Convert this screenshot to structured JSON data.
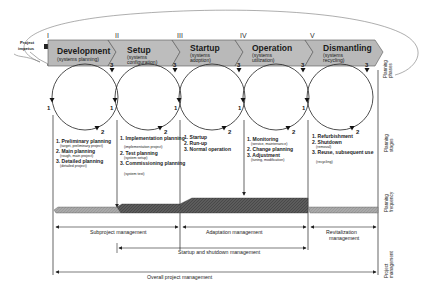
{
  "diagram": {
    "project_impetus": [
      "Project",
      "impetus"
    ],
    "phases": [
      {
        "roman": "I",
        "title": "Development",
        "subtitle": [
          "(systems planning)"
        ]
      },
      {
        "roman": "II",
        "title": "Setup",
        "subtitle": [
          "(systems",
          "configuration)"
        ]
      },
      {
        "roman": "III",
        "title": "Startup",
        "subtitle": [
          "(systems",
          "adoption)"
        ]
      },
      {
        "roman": "IV",
        "title": "Operation",
        "subtitle": [
          "(systems",
          "utilization)"
        ]
      },
      {
        "roman": "V",
        "title": "Dismantling",
        "subtitle": [
          "(systems",
          "recycling)"
        ]
      }
    ],
    "cycle_numbers": [
      "1",
      "2",
      "3"
    ],
    "stages": [
      {
        "items": [
          {
            "label": "1. Preliminary planning",
            "sub": "(target, preliminary project)"
          },
          {
            "label": "2. Main planning",
            "sub": "(rough, main project)"
          },
          {
            "label": "3. Detailed planning",
            "sub": "(detailed project)"
          }
        ]
      },
      {
        "items": [
          {
            "label": "1. Implementation planning",
            "sub": "(implementation project)"
          },
          {
            "label": "2. Test planning",
            "sub": "(system setup)"
          },
          {
            "label": "3. Commissioning planning",
            "sub": "(system test)"
          }
        ]
      },
      {
        "items": [
          {
            "label": "1. Startup",
            "sub": ""
          },
          {
            "label": "2. Run-up",
            "sub": ""
          },
          {
            "label": "3. Normal operation",
            "sub": ""
          }
        ]
      },
      {
        "items": [
          {
            "label": "1. Monitoring",
            "sub": "(service, maintenance)"
          },
          {
            "label": "2. Change planning",
            "sub": ""
          },
          {
            "label": "3. Adjustment",
            "sub": "(tuning, modification)"
          }
        ]
      },
      {
        "items": [
          {
            "label": "1. Refurbishment",
            "sub": ""
          },
          {
            "label": "2. Shutdown",
            "sub": "(removal)"
          },
          {
            "label": "3. Reuse, subsequent use",
            "sub": "(recycling)"
          }
        ]
      }
    ],
    "management": {
      "subproject": "Subproject management",
      "adaptation": "Adaptation management",
      "revitalization": [
        "Revitalization",
        "management"
      ],
      "startup_shutdown": "Startup and shutdown management",
      "overall": "Overall project management"
    },
    "side_labels": {
      "planning_phases": [
        "Planning",
        "phases"
      ],
      "planning_stages": [
        "Planning",
        "stages"
      ],
      "planning_frequency": [
        "Planning",
        "frequency"
      ],
      "project_management": [
        "Project",
        "management"
      ]
    },
    "colors": {
      "arrow_fill": "#b9b9b9",
      "arrow_stroke": "#555555",
      "frequency_light": "#a8a8a8",
      "frequency_dark": "#5a5a5a",
      "line": "#222222"
    }
  }
}
